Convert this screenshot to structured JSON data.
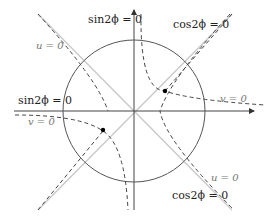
{
  "diagram": {
    "title": "",
    "colors": {
      "axis": "#444444",
      "circle": "#555555",
      "diagonals": "#c8c8c8",
      "curves": "#444444",
      "points": "#000000",
      "label_dark": "#222222",
      "label_grey": "#777777"
    },
    "labels": {
      "sin_top": "sin2ϕ = 0",
      "cos_top_right": "cos2ϕ = 0",
      "u_top_left": "u = 0",
      "v_right": "v = 0",
      "sin_left": "sin2ϕ = 0",
      "v_left": "v = 0",
      "u_bottom_right": "u = 0",
      "cos_bottom_right": "cos2ϕ = 0"
    },
    "elements": {
      "axes": [
        "horizontal axis with arrow",
        "vertical axis with arrow"
      ],
      "circle": "circle centered at origin",
      "diagonals": [
        "y = x line",
        "y = -x line"
      ],
      "curves": [
        "u = 0 hyperbola branches",
        "v = 0 hyperbola branches"
      ],
      "points": 2
    }
  }
}
